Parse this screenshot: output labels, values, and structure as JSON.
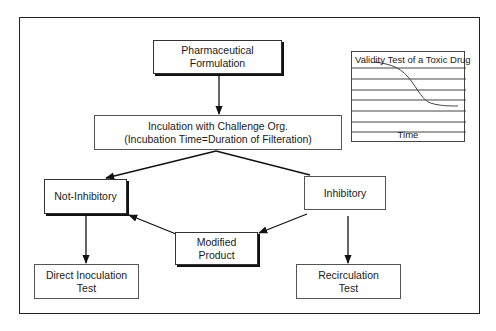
{
  "diagram": {
    "nodes": {
      "formulation": {
        "line1": "Pharmaceutical",
        "line2": "Formulation"
      },
      "incubation": {
        "line1": "Inculation with Challenge Org.",
        "line2": "(Incubation Time=Duration of Filteration)"
      },
      "not_inhibitory": {
        "label": "Not-Inhibitory"
      },
      "inhibitory": {
        "label": "Inhibitory"
      },
      "modified": {
        "line1": "Modified",
        "line2": "Product"
      },
      "direct": {
        "line1": "Direct Inoculation",
        "line2": "Test"
      },
      "recirculation": {
        "line1": "Recirculation",
        "line2": "Test"
      }
    },
    "edges": [
      {
        "from": "formulation",
        "to": "incubation",
        "arrow": true
      },
      {
        "from": "incubation",
        "to": "not_inhibitory",
        "arrow": true
      },
      {
        "from": "incubation",
        "to": "inhibitory",
        "arrow": false
      },
      {
        "from": "inhibitory",
        "to": "modified",
        "arrow": true
      },
      {
        "from": "modified",
        "to": "not_inhibitory",
        "arrow": true
      },
      {
        "from": "not_inhibitory",
        "to": "direct",
        "arrow": true
      },
      {
        "from": "inhibitory",
        "to": "recirculation",
        "arrow": true
      }
    ],
    "inset_chart": {
      "title": "Validity Test of a Toxic Drug",
      "xlabel": "Time",
      "gridlines": 7,
      "curve": "decreasing sigmoid"
    }
  }
}
